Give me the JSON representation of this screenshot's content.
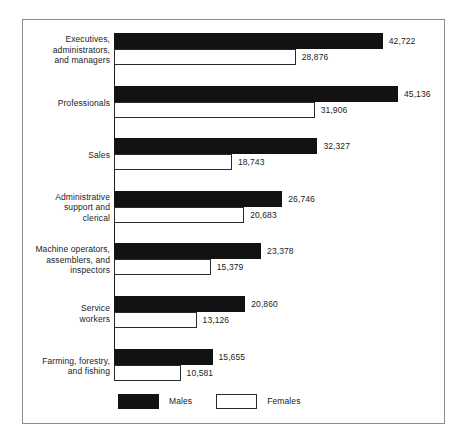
{
  "chart_data": {
    "type": "bar",
    "orientation": "horizontal",
    "title": "",
    "subtitle": "",
    "xlabel": "",
    "ylabel": "",
    "grid": false,
    "legend_position": "bottom",
    "axis_baseline": 0,
    "xlim": [
      0,
      45136
    ],
    "categories": [
      "Executives,\nadministrators,\nand managers",
      "Professionals",
      "Sales",
      "Administrative\nsupport and\nclerical",
      "Machine operators,\nassemblers, and\ninspectors",
      "Service\nworkers",
      "Farming, forestry,\nand fishing"
    ],
    "series": [
      {
        "name": "Males",
        "color": "#121212",
        "values": [
          42722,
          45136,
          32327,
          26746,
          23378,
          20860,
          15655
        ],
        "labels": [
          "42,722",
          "45,136",
          "32,327",
          "26,746",
          "23,378",
          "20,860",
          "15,655"
        ]
      },
      {
        "name": "Females",
        "color": "#ffffff",
        "values": [
          28876,
          31906,
          18743,
          20683,
          15379,
          13126,
          10581
        ],
        "labels": [
          "28,876",
          "31,906",
          "18,743",
          "20,683",
          "15,379",
          "13,126",
          "10,581"
        ]
      }
    ]
  },
  "legend": {
    "items": [
      {
        "label": "Males",
        "swatch": "males"
      },
      {
        "label": "Females",
        "swatch": "females"
      }
    ]
  }
}
